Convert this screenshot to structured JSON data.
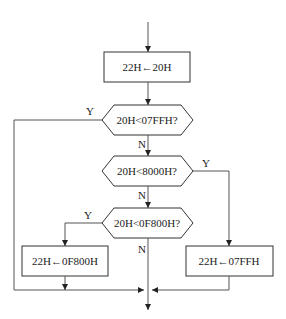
{
  "flowchart": {
    "process_start": "22H←20H",
    "decision_1": "20H<07FFH?",
    "decision_2": "20H<8000H?",
    "decision_3": "20H<0F800H?",
    "process_left": "22H←0F800H",
    "process_right": "22H←07FFH",
    "labels": {
      "d1_yes": "Y",
      "d1_no": "N",
      "d2_yes": "Y",
      "d2_no": "N",
      "d3_yes": "Y",
      "d3_no": "N"
    }
  }
}
